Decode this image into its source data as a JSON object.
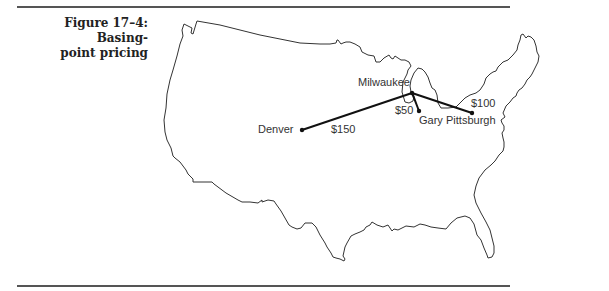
{
  "figure": {
    "caption_line1": "Figure 17–4: Basing-",
    "caption_line2": "point pricing"
  },
  "map": {
    "region": "Continental United States outline",
    "cities": [
      {
        "name": "Milwaukee",
        "role": "hub"
      },
      {
        "name": "Denver"
      },
      {
        "name": "Gary"
      },
      {
        "name": "Pittsburgh"
      }
    ],
    "routes": [
      {
        "from": "Milwaukee",
        "to": "Denver",
        "cost_label": "$150"
      },
      {
        "from": "Milwaukee",
        "to": "Gary",
        "cost_label": "$50"
      },
      {
        "from": "Milwaukee",
        "to": "Pittsburgh",
        "cost_label": "$100"
      }
    ],
    "colors": {
      "outline": "#333333",
      "route": "#111111",
      "text": "#333333"
    }
  }
}
